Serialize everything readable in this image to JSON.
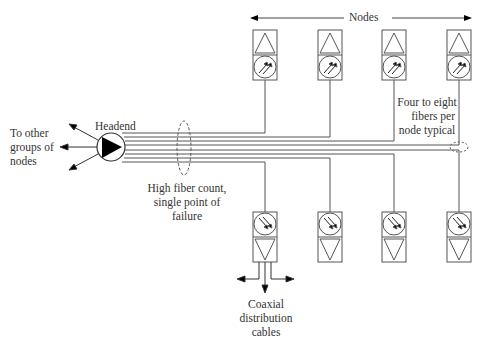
{
  "diagram": {
    "headend": {
      "label": "Headend"
    },
    "to_other_groups": {
      "label_lines": [
        "To other",
        "groups of",
        "nodes"
      ]
    },
    "nodes_label": "Nodes",
    "fiber_bundle_note": {
      "label_lines": [
        "High fiber count,",
        "single point of",
        "failure"
      ]
    },
    "fibers_per_node_note": {
      "label_lines": [
        "Four to eight",
        "fibers per",
        "node typical"
      ]
    },
    "coax_note": {
      "label_lines": [
        "Coaxial",
        "distribution",
        "cables"
      ]
    },
    "top_nodes": [
      {
        "id": "node-top-1"
      },
      {
        "id": "node-top-2"
      },
      {
        "id": "node-top-3"
      },
      {
        "id": "node-top-4"
      }
    ],
    "bottom_nodes": [
      {
        "id": "node-bottom-1"
      },
      {
        "id": "node-bottom-2"
      },
      {
        "id": "node-bottom-3"
      },
      {
        "id": "node-bottom-4"
      }
    ],
    "colors": {
      "line": "#555555",
      "fill": "#000000",
      "text": "#333333"
    }
  }
}
